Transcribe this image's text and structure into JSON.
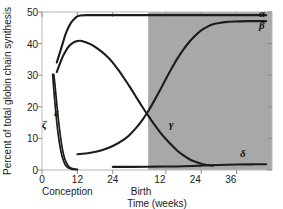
{
  "chart_data": {
    "type": "line",
    "title": "",
    "xlabel": "Time (weeks)",
    "ylabel": "Percent of total globin chain synthesis",
    "ylim": [
      0,
      50
    ],
    "yticks": [
      0,
      10,
      20,
      30,
      40,
      50
    ],
    "ytick_labels": [
      "0",
      "10",
      "20",
      "30",
      "40",
      "50"
    ],
    "xlim": [
      0,
      78
    ],
    "xticks": [
      0,
      12,
      24,
      42,
      54,
      66
    ],
    "xtick_labels": [
      "0",
      "12",
      "24",
      "12",
      "24",
      "36"
    ],
    "grid": false,
    "legend": "inline-curve-labels",
    "annotations": [
      {
        "text": "Conception",
        "x": 0,
        "position": "below-axis-left"
      },
      {
        "text": "Birth",
        "x": 40,
        "position": "below-axis-center"
      }
    ],
    "shaded_region": {
      "label": "postnatal",
      "x_start": 36,
      "x_end": 78,
      "color": "#a8a8a8"
    },
    "series": [
      {
        "name": "alpha",
        "label": "α",
        "points": [
          [
            5,
            34
          ],
          [
            6,
            37
          ],
          [
            7,
            40
          ],
          [
            8,
            43
          ],
          [
            9,
            45.2
          ],
          [
            10,
            46.8
          ],
          [
            11,
            47.9
          ],
          [
            12,
            48.6
          ],
          [
            13,
            48.9
          ],
          [
            15,
            49.0
          ],
          [
            20,
            49.0
          ],
          [
            30,
            49.0
          ],
          [
            40,
            49.0
          ],
          [
            50,
            49.0
          ],
          [
            60,
            49.0
          ],
          [
            70,
            49.0
          ],
          [
            76,
            49.0
          ]
        ]
      },
      {
        "name": "gamma-prenatal-peak",
        "label": "γ",
        "points": [
          [
            5,
            31
          ],
          [
            6,
            33.5
          ],
          [
            7,
            35.8
          ],
          [
            8,
            37.6
          ],
          [
            9,
            39.0
          ],
          [
            10,
            39.9
          ],
          [
            11,
            40.5
          ],
          [
            12,
            40.8
          ],
          [
            13,
            40.9
          ],
          [
            14,
            40.7
          ],
          [
            16,
            40.0
          ],
          [
            18,
            39.0
          ],
          [
            20,
            37.6
          ],
          [
            22,
            36.0
          ],
          [
            24,
            34.0
          ],
          [
            26,
            31.5
          ],
          [
            28,
            28.8
          ],
          [
            30,
            26.0
          ],
          [
            32,
            23.0
          ],
          [
            34,
            20.0
          ],
          [
            36,
            17.2
          ],
          [
            38,
            14.5
          ],
          [
            40,
            12.0
          ],
          [
            42,
            9.8
          ],
          [
            44,
            7.8
          ],
          [
            46,
            6.0
          ],
          [
            48,
            4.6
          ],
          [
            50,
            3.4
          ],
          [
            52,
            2.6
          ],
          [
            54,
            2.0
          ],
          [
            56,
            1.6
          ],
          [
            58,
            1.4
          ]
        ]
      },
      {
        "name": "beta",
        "label": "β",
        "points": [
          [
            12,
            5.0
          ],
          [
            16,
            5.4
          ],
          [
            20,
            6.2
          ],
          [
            24,
            7.6
          ],
          [
            28,
            9.8
          ],
          [
            30,
            11.4
          ],
          [
            32,
            13.4
          ],
          [
            34,
            15.8
          ],
          [
            36,
            18.6
          ],
          [
            38,
            21.8
          ],
          [
            40,
            25.2
          ],
          [
            42,
            28.8
          ],
          [
            44,
            32.2
          ],
          [
            46,
            35.4
          ],
          [
            48,
            38.2
          ],
          [
            50,
            40.6
          ],
          [
            52,
            42.6
          ],
          [
            54,
            44.2
          ],
          [
            56,
            45.3
          ],
          [
            58,
            46.1
          ],
          [
            60,
            46.5
          ],
          [
            62,
            46.8
          ],
          [
            65,
            47.0
          ],
          [
            70,
            47.1
          ],
          [
            76,
            47.1
          ]
        ]
      },
      {
        "name": "epsilon",
        "label": "ε",
        "points": [
          [
            4,
            30.3
          ],
          [
            4.5,
            26.0
          ],
          [
            5,
            21.0
          ],
          [
            5.5,
            16.5
          ],
          [
            6,
            12.5
          ],
          [
            6.5,
            9.0
          ],
          [
            7,
            6.2
          ],
          [
            7.5,
            4.2
          ],
          [
            8,
            2.8
          ],
          [
            8.5,
            1.9
          ],
          [
            9,
            1.2
          ],
          [
            9.5,
            0.8
          ],
          [
            10,
            0.5
          ],
          [
            11,
            0.3
          ],
          [
            12,
            0.2
          ]
        ]
      },
      {
        "name": "zeta",
        "label": "ζ",
        "points": [
          [
            3.6,
            30.3
          ],
          [
            4,
            25.5
          ],
          [
            4.5,
            20.0
          ],
          [
            5,
            15.2
          ],
          [
            5.5,
            11.2
          ],
          [
            6,
            8.0
          ],
          [
            6.5,
            5.5
          ],
          [
            7,
            3.7
          ],
          [
            7.5,
            2.4
          ],
          [
            8,
            1.5
          ],
          [
            8.5,
            1.0
          ],
          [
            9,
            0.6
          ],
          [
            10,
            0.3
          ],
          [
            11,
            0.2
          ],
          [
            12,
            0.15
          ]
        ]
      },
      {
        "name": "delta",
        "label": "δ",
        "points": [
          [
            24,
            1.0
          ],
          [
            30,
            1.0
          ],
          [
            36,
            1.05
          ],
          [
            42,
            1.1
          ],
          [
            48,
            1.2
          ],
          [
            54,
            1.4
          ],
          [
            60,
            1.6
          ],
          [
            66,
            1.75
          ],
          [
            72,
            1.8
          ],
          [
            76,
            1.8
          ]
        ]
      }
    ]
  },
  "axes": {
    "y_label": "Percent of total globin chain synthesis",
    "x_label": "Time (weeks)",
    "y_ticks": [
      "50",
      "40",
      "30",
      "20",
      "10",
      "0"
    ],
    "x_ticks_prenatal": [
      "0",
      "12",
      "24"
    ],
    "x_ticks_postnatal": [
      "12",
      "24",
      "36"
    ],
    "conception_label": "Conception",
    "birth_label": "Birth"
  },
  "series_labels": {
    "alpha": "α",
    "beta": "β",
    "gamma": "γ",
    "delta": "δ",
    "epsilon": "ε",
    "zeta": "ζ"
  },
  "colors": {
    "curve": "#1c1c1c",
    "shaded_region": "#a8a8a8",
    "frame": "#b9b9b9",
    "background": "#ffffff",
    "text": "#1a1a1a"
  }
}
